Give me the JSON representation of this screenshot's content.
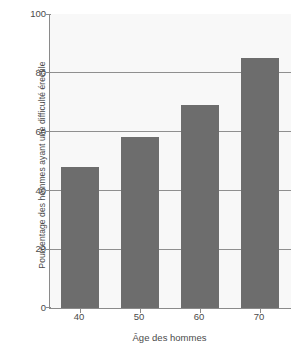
{
  "chart_data": {
    "type": "bar",
    "title": "",
    "xlabel": "Âge des hommes",
    "ylabel": "Pourcentage des hommes ayant une difficulté érectile",
    "categories": [
      "40",
      "50",
      "60",
      "70"
    ],
    "values": [
      48,
      58,
      69,
      85
    ],
    "ylim": [
      0,
      100
    ],
    "yticks": [
      100,
      80,
      60,
      40,
      20,
      0
    ],
    "ytick_labels": [
      "100",
      "80",
      "60",
      "40",
      "20",
      "0"
    ],
    "grid": true,
    "legend": "none",
    "bar_color": "#6d6d6d",
    "plot_background": "#f8f8f8",
    "axis_color": "#8a8a8a"
  }
}
